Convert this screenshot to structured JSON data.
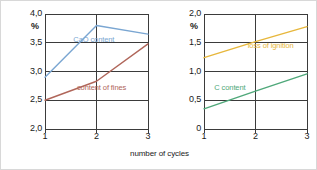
{
  "figure": {
    "xlabel": "number of cycles",
    "background": "#ffffff",
    "border_color": "#d8d8d8",
    "axis_color": "#3b3b3b",
    "tick_color": "#1a1a1a"
  },
  "chart_data": [
    {
      "id": "left",
      "type": "line",
      "title": "",
      "xlabel": "number of cycles",
      "ylabel": "%",
      "x": [
        1,
        2,
        3
      ],
      "xticks": [
        "1",
        "2",
        "3"
      ],
      "xlim": [
        1,
        3
      ],
      "ylim": [
        2.0,
        4.0
      ],
      "yticks": [
        "2,0",
        "2,5",
        "3,0",
        "3,5",
        "4,0"
      ],
      "ytick_values": [
        2.0,
        2.5,
        3.0,
        3.5,
        4.0
      ],
      "grid": true,
      "legend": "inline-labels",
      "series": [
        {
          "name": "CaO content",
          "values": [
            2.9,
            3.8,
            3.65
          ],
          "color": "#7aa6d2",
          "label_x": 1.55,
          "label_y": 3.55
        },
        {
          "name": "content of fines",
          "values": [
            2.5,
            2.83,
            3.48
          ],
          "color": "#b0665a",
          "label_x": 1.62,
          "label_y": 2.72
        }
      ]
    },
    {
      "id": "right",
      "type": "line",
      "title": "",
      "xlabel": "number of cycles",
      "ylabel": "%",
      "x": [
        1,
        2,
        3
      ],
      "xticks": [
        "1",
        "2",
        "3"
      ],
      "xlim": [
        1,
        3
      ],
      "ylim": [
        0.0,
        2.0
      ],
      "yticks": [
        "0",
        "0,5",
        "1,0",
        "1,5",
        "2,0"
      ],
      "ytick_values": [
        0.0,
        0.5,
        1.0,
        1.5,
        2.0
      ],
      "grid": true,
      "legend": "inline-labels",
      "series": [
        {
          "name": "loss of ignition",
          "values": [
            1.24,
            1.52,
            1.78
          ],
          "color": "#e7b73c",
          "label_x": 1.85,
          "label_y": 1.44
        },
        {
          "name": "C content",
          "values": [
            0.35,
            0.66,
            0.96
          ],
          "color": "#4fa87a",
          "label_x": 1.2,
          "label_y": 0.72
        }
      ]
    }
  ]
}
